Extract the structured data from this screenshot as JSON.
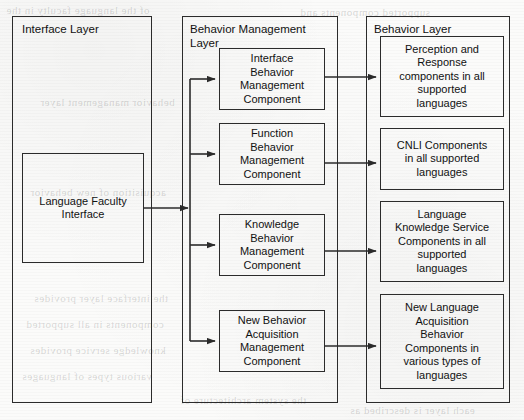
{
  "diagram": {
    "stroke_color": "#2b2b2b",
    "background_color": "#fbfbfa"
  },
  "layers": [
    {
      "id": "interface-layer",
      "label": "Interface Layer",
      "components": [
        {
          "id": "language-faculty-interface",
          "label": "Language Faculty\nInterface"
        }
      ]
    },
    {
      "id": "behavior-management-layer",
      "label": "Behavior Management\nLayer",
      "components": [
        {
          "id": "interface-behavior-management-component",
          "label": "Interface\nBehavior\nManagement\nComponent"
        },
        {
          "id": "function-behavior-management-component",
          "label": "Function\nBehavior\nManagement\nComponent"
        },
        {
          "id": "knowledge-behavior-management-component",
          "label": "Knowledge\nBehavior\nManagement\nComponent"
        },
        {
          "id": "new-behavior-acquisition-management-component",
          "label": "New Behavior\nAcquisition\nManagement\nComponent"
        }
      ]
    },
    {
      "id": "behavior-layer",
      "label": "Behavior Layer",
      "components": [
        {
          "id": "perception-response-components",
          "label": "Perception and\nResponse\ncomponents in all\nsupported\nlanguages"
        },
        {
          "id": "cnli-components",
          "label": "CNLI Components\nin all supported\nlanguages"
        },
        {
          "id": "language-knowledge-service-components",
          "label": "Language\nKnowledge Service\nComponents in all\nsupported\nlanguages"
        },
        {
          "id": "new-language-acquisition-behavior-components",
          "label": "New Language\nAcquisition\nBehavior\nComponents in\nvarious types of\nlanguages"
        }
      ]
    }
  ],
  "connections": [
    {
      "id": "iface-to-bus",
      "from": "language-faculty-interface",
      "to": "behavior-management-bus",
      "style": "arrow"
    },
    {
      "id": "bus-to-interface-bmc",
      "from": "behavior-management-bus",
      "to": "interface-behavior-management-component",
      "style": "arrow"
    },
    {
      "id": "bus-to-function-bmc",
      "from": "behavior-management-bus",
      "to": "function-behavior-management-component",
      "style": "arrow"
    },
    {
      "id": "bus-to-knowledge-bmc",
      "from": "behavior-management-bus",
      "to": "knowledge-behavior-management-component",
      "style": "arrow"
    },
    {
      "id": "bus-to-new-behavior-bmc",
      "from": "behavior-management-bus",
      "to": "new-behavior-acquisition-management-component",
      "style": "arrow"
    },
    {
      "id": "interface-bmc-to-perception",
      "from": "interface-behavior-management-component",
      "to": "perception-response-components",
      "style": "arrow"
    },
    {
      "id": "function-bmc-to-cnli",
      "from": "function-behavior-management-component",
      "to": "cnli-components",
      "style": "arrow"
    },
    {
      "id": "knowledge-bmc-to-lks",
      "from": "knowledge-behavior-management-component",
      "to": "language-knowledge-service-components",
      "style": "arrow"
    },
    {
      "id": "new-behavior-bmc-to-nlab",
      "from": "new-behavior-acquisition-management-component",
      "to": "new-language-acquisition-behavior-components",
      "style": "arrow"
    }
  ],
  "background_artifacts": {
    "note": "faint reverse-side print bleed-through from scanned page",
    "lines": [
      "of the language faculty in the",
      "supported components and",
      "behavior management layer",
      "acquisition of new behavior",
      "the interface layer provides",
      "components in all supported",
      "knowledge service provides",
      "various types of languages",
      "the system architecture of",
      "each layer is described as"
    ]
  }
}
